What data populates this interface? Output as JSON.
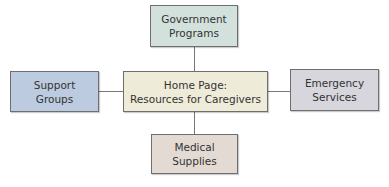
{
  "diagram": {
    "center": {
      "label_line1": "Home Page:",
      "label_line2": "Resources for Caregivers",
      "color": "#eeebd9"
    },
    "top": {
      "label_line1": "Government",
      "label_line2": "Programs",
      "color": "#d3e1dc"
    },
    "left": {
      "label_line1": "Support",
      "label_line2": "Groups",
      "color": "#bccbe0"
    },
    "right": {
      "label_line1": "Emergency",
      "label_line2": "Services",
      "color": "#d6d6dc"
    },
    "bottom": {
      "label_line1": "Medical",
      "label_line2": "Supplies",
      "color": "#e3dbd3"
    }
  }
}
